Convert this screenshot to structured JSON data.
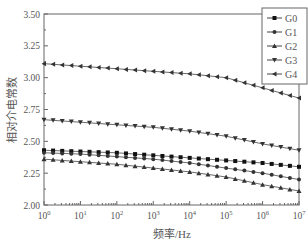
{
  "chart_data": {
    "type": "line",
    "title": "",
    "xlabel": "频率/Hz",
    "ylabel": "相对介电常数",
    "xscale": "log",
    "xlim": [
      1,
      10000000
    ],
    "ylim": [
      2.0,
      3.5
    ],
    "x_tick_labels": [
      "10^0",
      "10^1",
      "10^2",
      "10^3",
      "10^4",
      "10^5",
      "10^6",
      "10^7"
    ],
    "y_tick_labels": [
      "2.00",
      "2.25",
      "2.50",
      "2.75",
      "3.00",
      "3.25",
      "3.50"
    ],
    "grid": false,
    "legend_position": "upper right",
    "x_log10": [
      0,
      1,
      2,
      3,
      4,
      5,
      6,
      7
    ],
    "series": [
      {
        "name": "G0",
        "marker": "square",
        "values": [
          2.43,
          2.42,
          2.41,
          2.39,
          2.37,
          2.35,
          2.33,
          2.3
        ]
      },
      {
        "name": "G1",
        "marker": "circle",
        "values": [
          2.41,
          2.4,
          2.38,
          2.36,
          2.33,
          2.29,
          2.25,
          2.2
        ]
      },
      {
        "name": "G2",
        "marker": "triangle-up",
        "values": [
          2.36,
          2.34,
          2.32,
          2.29,
          2.26,
          2.22,
          2.16,
          2.11
        ]
      },
      {
        "name": "G3",
        "marker": "triangle-down",
        "values": [
          2.67,
          2.65,
          2.63,
          2.61,
          2.58,
          2.54,
          2.48,
          2.43
        ]
      },
      {
        "name": "G4",
        "marker": "triangle-left",
        "values": [
          3.11,
          3.09,
          3.07,
          3.05,
          3.03,
          3.0,
          2.92,
          2.84
        ]
      }
    ]
  },
  "legend": {
    "items": [
      "G0",
      "G1",
      "G2",
      "G3",
      "G4"
    ]
  },
  "axes": {
    "xlabel": "频率/Hz",
    "ylabel": "相对介电常数"
  }
}
